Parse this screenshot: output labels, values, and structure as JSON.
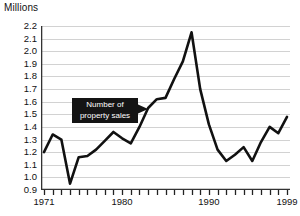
{
  "chart_data": {
    "type": "line",
    "title": "",
    "unit_label": "Millions",
    "ylabel": "Millions",
    "xlabel": "",
    "ylim": [
      0.9,
      2.2
    ],
    "xlim": [
      1971,
      1999
    ],
    "grid": true,
    "legend_position": "none",
    "ytick_labels": [
      "2.2",
      "2.1",
      "2.0",
      "1.9",
      "1.8",
      "1.7",
      "1.6",
      "1.5",
      "1.4",
      "1.3",
      "1.2",
      "1.1",
      "1.0",
      "0.9"
    ],
    "ytick_values": [
      2.2,
      2.1,
      2.0,
      1.9,
      1.8,
      1.7,
      1.6,
      1.5,
      1.4,
      1.3,
      1.2,
      1.1,
      1.0,
      0.9
    ],
    "xtick_labels": [
      "1971",
      "1980",
      "1990",
      "1999"
    ],
    "xtick_values": [
      1971,
      1980,
      1990,
      1999
    ],
    "annotations": [
      {
        "name": "series-callout",
        "line1": "Number of",
        "line2": "property sales",
        "text": "Number of property sales",
        "color": "#141414",
        "text_color": "#ffffff"
      }
    ],
    "series": [
      {
        "name": "Number of property sales",
        "color": "#111111",
        "x": [
          1971,
          1972,
          1973,
          1974,
          1975,
          1976,
          1977,
          1978,
          1979,
          1980,
          1981,
          1982,
          1983,
          1984,
          1985,
          1986,
          1987,
          1988,
          1989,
          1990,
          1991,
          1992,
          1993,
          1994,
          1995,
          1996,
          1997,
          1998,
          1999
        ],
        "values": [
          1.2,
          1.34,
          1.3,
          0.95,
          1.16,
          1.17,
          1.22,
          1.29,
          1.36,
          1.31,
          1.27,
          1.4,
          1.55,
          1.62,
          1.63,
          1.78,
          1.92,
          2.15,
          1.7,
          1.42,
          1.22,
          1.13,
          1.18,
          1.24,
          1.13,
          1.28,
          1.4,
          1.35,
          1.48
        ]
      }
    ]
  }
}
